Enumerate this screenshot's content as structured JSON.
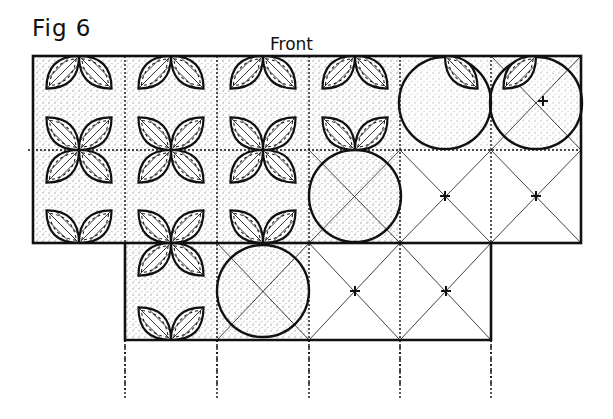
{
  "figure": {
    "title": "Fig 6",
    "side_label": "Front"
  },
  "diagram": {
    "type": "quilt-block-layout",
    "pattern": "overlapping circles (orange peel / cathedral window) on square grid with diagonal guides",
    "grid": {
      "columns_x": [
        33,
        125,
        217,
        309,
        400,
        491,
        581
      ],
      "rows_y": [
        56,
        150,
        243,
        340
      ],
      "top_section": {
        "cols": 6,
        "rows": 2
      },
      "bottom_section": {
        "cols": 4,
        "rows": 1,
        "offset_cols": 1
      }
    },
    "colors": {
      "ink": "#111111",
      "paper": "#ffffff",
      "stipple": "#555555"
    }
  }
}
